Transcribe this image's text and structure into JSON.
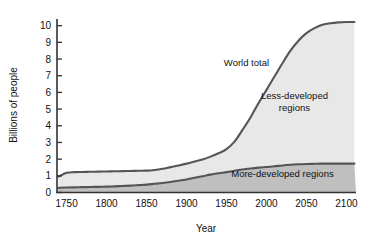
{
  "chart_data": {
    "type": "area",
    "title": "",
    "xlabel": "Year",
    "ylabel": "Billions of people",
    "xlim": [
      1738,
      2112
    ],
    "ylim": [
      0,
      10.4
    ],
    "grid": false,
    "legend_position": "inline-annotations",
    "xticks": [
      1750,
      1800,
      1850,
      1900,
      1950,
      2000,
      2050,
      2100
    ],
    "xtick_labels": [
      "1750",
      "1800",
      "1850",
      "1900",
      "1950",
      "2000",
      "2050",
      "2100"
    ],
    "yticks": [
      0,
      1,
      2,
      3,
      4,
      5,
      6,
      7,
      8,
      9,
      10
    ],
    "ytick_labels": [
      "0",
      "1",
      "2",
      "3",
      "4",
      "5",
      "6",
      "7",
      "8",
      "9",
      "10"
    ],
    "x": [
      1740,
      1750,
      1760,
      1770,
      1780,
      1790,
      1800,
      1810,
      1820,
      1830,
      1840,
      1850,
      1860,
      1870,
      1880,
      1890,
      1900,
      1910,
      1920,
      1930,
      1940,
      1950,
      1960,
      1970,
      1980,
      1990,
      2000,
      2010,
      2020,
      2030,
      2040,
      2050,
      2060,
      2070,
      2080,
      2090,
      2100,
      2110
    ],
    "series": [
      {
        "name": "World total",
        "stacking": "top-boundary",
        "values": [
          0.95,
          1.18,
          1.22,
          1.23,
          1.24,
          1.25,
          1.26,
          1.27,
          1.28,
          1.29,
          1.3,
          1.31,
          1.35,
          1.42,
          1.52,
          1.62,
          1.73,
          1.86,
          1.98,
          2.15,
          2.35,
          2.6,
          3.05,
          3.75,
          4.5,
          5.35,
          6.15,
          6.95,
          7.75,
          8.5,
          9.1,
          9.55,
          9.85,
          10.05,
          10.15,
          10.2,
          10.22,
          10.22
        ]
      },
      {
        "name": "More-developed regions",
        "stacking": "bottom-band",
        "values": [
          0.28,
          0.3,
          0.31,
          0.32,
          0.33,
          0.34,
          0.35,
          0.37,
          0.39,
          0.41,
          0.44,
          0.47,
          0.52,
          0.57,
          0.63,
          0.7,
          0.78,
          0.88,
          0.97,
          1.07,
          1.15,
          1.22,
          1.3,
          1.38,
          1.44,
          1.49,
          1.53,
          1.57,
          1.62,
          1.66,
          1.69,
          1.71,
          1.72,
          1.73,
          1.73,
          1.73,
          1.73,
          1.73
        ]
      },
      {
        "name": "Less-developed regions",
        "stacking": "middle-band",
        "values": [
          0.67,
          0.88,
          0.91,
          0.91,
          0.91,
          0.91,
          0.91,
          0.9,
          0.89,
          0.88,
          0.86,
          0.84,
          0.83,
          0.85,
          0.89,
          0.92,
          0.95,
          0.98,
          1.01,
          1.08,
          1.2,
          1.38,
          1.75,
          2.37,
          3.06,
          3.86,
          4.62,
          5.38,
          6.13,
          6.84,
          7.41,
          7.84,
          8.13,
          8.32,
          8.42,
          8.47,
          8.49,
          8.49
        ]
      }
    ],
    "annotations": [
      {
        "name": "World total",
        "text": "World total",
        "x": 1975,
        "y": 7.6
      },
      {
        "name": "Less-developed regions",
        "text_lines": [
          "Less-developed",
          "regions"
        ],
        "x": 2035,
        "y": 5.6
      },
      {
        "name": "More-developed regions",
        "text": "More-developed regions",
        "x": 2020,
        "y": 0.95
      }
    ],
    "colors": {
      "curve": "#555555",
      "above_world_total_fill": "#ffffff",
      "less_developed_fill": "#e8e8e8",
      "more_developed_fill": "#bfbfbf",
      "axis": "#333333",
      "text": "#111111",
      "background": "#ffffff"
    }
  }
}
